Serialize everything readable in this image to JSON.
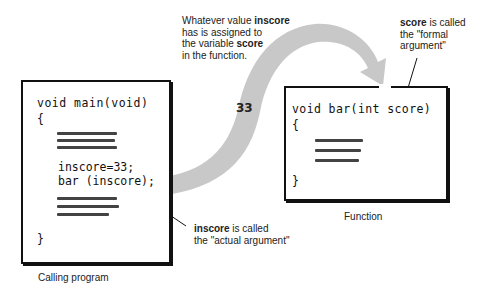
{
  "top_note": {
    "line1_prefix": "Whatever value ",
    "line1_bold": "inscore",
    "line2": "has is assigned to",
    "line3_prefix": "the variable ",
    "line3_bold": "score",
    "line4": "in the function."
  },
  "formal_note": {
    "bold": "score",
    "line1_suffix": " is called",
    "line2": "the \"formal",
    "line3": "argument\""
  },
  "actual_note": {
    "bold": "inscore",
    "line1_suffix": " is called",
    "line2": "the \"actual argument\""
  },
  "flow_value": "33",
  "calling_program": {
    "header": "void main(void)",
    "open_brace": "{",
    "assign_line": "inscore=33;",
    "call_line": "bar (inscore);",
    "close_brace": "}",
    "caption": "Calling program"
  },
  "function": {
    "header": "void bar(int score)",
    "open_brace": "{",
    "close_brace": "}",
    "caption": "Function"
  },
  "colors": {
    "arrow_fill": "#c8c8c8",
    "box_border": "#111111"
  }
}
